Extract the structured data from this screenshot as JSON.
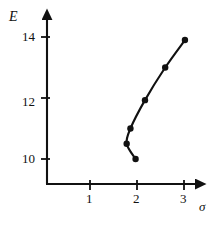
{
  "chart_data": {
    "type": "line",
    "title": "",
    "subtitle": "",
    "xlabel": "σ",
    "ylabel": "E",
    "grid": false,
    "legend": null,
    "xlim": [
      0.0,
      3.35
    ],
    "ylim": [
      9.2,
      14.45
    ],
    "xticks": [
      1,
      2,
      3
    ],
    "yticks": [
      10,
      12,
      14
    ],
    "xtick_labels": [
      "1",
      "2",
      "3"
    ],
    "ytick_labels": [
      "10",
      "12",
      "14"
    ],
    "marker": "filled-circle",
    "line_color": "#111111",
    "marker_color": "#111111",
    "series": [
      {
        "name": "E vs sigma",
        "points": [
          {
            "x": 1.97,
            "y": 10.0
          },
          {
            "x": 1.78,
            "y": 10.5
          },
          {
            "x": 1.86,
            "y": 11.0
          },
          {
            "x": 2.17,
            "y": 11.93
          },
          {
            "x": 2.6,
            "y": 13.0
          },
          {
            "x": 3.02,
            "y": 13.9
          }
        ]
      }
    ]
  },
  "axes": {
    "y_title": "E",
    "x_title": "σ",
    "y_tick_0": "14",
    "y_tick_1": "12",
    "y_tick_2": "10",
    "x_tick_0": "1",
    "x_tick_1": "2",
    "x_tick_2": "3"
  },
  "colors": {
    "ink": "#111111",
    "background": "#ffffff"
  }
}
